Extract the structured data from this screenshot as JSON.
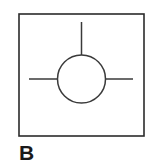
{
  "figure": {
    "label": "B",
    "label_position": "below-left",
    "background_color": "#ffffff",
    "stroke_color": "#3a3a3a",
    "frame_color": "#2b2b2b",
    "text_color": "#1a1a1a",
    "frame": {
      "x": 19,
      "y": 14,
      "width": 125,
      "height": 122
    },
    "symbol": {
      "name": "circle-with-three-leads",
      "circle": {
        "cx": 81.5,
        "cy": 79,
        "r": 24
      },
      "leads": [
        {
          "name": "top-lead",
          "x1": 81.5,
          "y1": 22,
          "x2": 81.5,
          "y2": 55
        },
        {
          "name": "left-lead",
          "x1": 29,
          "y1": 79,
          "x2": 57.5,
          "y2": 79
        },
        {
          "name": "right-lead",
          "x1": 105.5,
          "y1": 79,
          "x2": 133,
          "y2": 79
        }
      ]
    },
    "caption": {
      "x": 19,
      "y": 160
    }
  }
}
